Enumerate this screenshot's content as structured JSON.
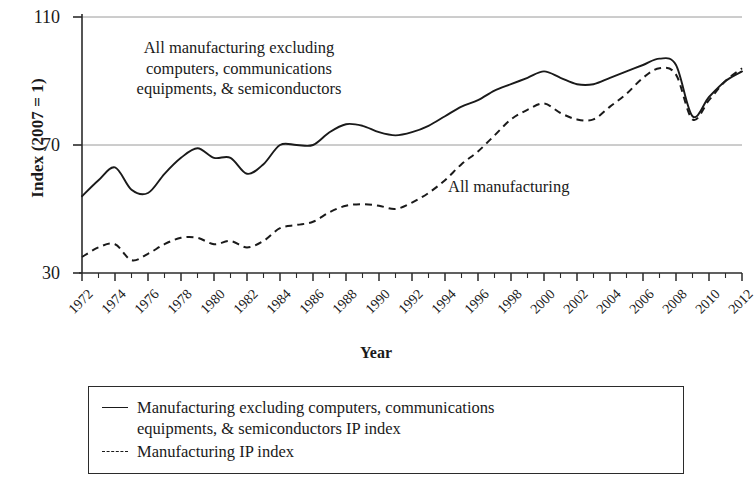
{
  "chart_data": {
    "type": "line",
    "title": "",
    "xlabel": "Year",
    "ylabel": "Index (2007 = 1)",
    "xlim": [
      1972,
      2012
    ],
    "ylim": [
      30,
      110
    ],
    "yticks": [
      30,
      70,
      110
    ],
    "ytick_labels": [
      "30",
      "70",
      "110"
    ],
    "xticks": [
      1972,
      1974,
      1976,
      1978,
      1980,
      1982,
      1984,
      1986,
      1988,
      1990,
      1992,
      1994,
      1996,
      1998,
      2000,
      2002,
      2004,
      2006,
      2008,
      2010,
      2012
    ],
    "xtick_labels": [
      "1972",
      "1974",
      "1976",
      "1978",
      "1980",
      "1982",
      "1984",
      "1986",
      "1988",
      "1990",
      "1992",
      "1994",
      "1996",
      "1998",
      "2000",
      "2002",
      "2004",
      "2006",
      "2008",
      "2010",
      "2012"
    ],
    "xtick_minor_step": 1,
    "grid": "horizontal gridlines at 70 and 110 only",
    "legend_position": "below plot, bordered box",
    "x": [
      1972,
      1973,
      1974,
      1975,
      1976,
      1977,
      1978,
      1979,
      1980,
      1981,
      1982,
      1983,
      1984,
      1985,
      1986,
      1987,
      1988,
      1989,
      1990,
      1991,
      1992,
      1993,
      1994,
      1995,
      1996,
      1997,
      1998,
      1999,
      2000,
      2001,
      2002,
      2003,
      2004,
      2005,
      2006,
      2007,
      2008,
      2009,
      2010,
      2011,
      2012
    ],
    "series": [
      {
        "name": "Manufacturing excluding computers, communications equipments, & semiconductors IP index",
        "style": "solid",
        "color": "#1a1a1a",
        "values": [
          54,
          59,
          63,
          56,
          55,
          61,
          66,
          69,
          66,
          66,
          61,
          64,
          70,
          70,
          70,
          74,
          76.5,
          76,
          74,
          73,
          74,
          76,
          79,
          82,
          84,
          87,
          89,
          91,
          93,
          91,
          89,
          89,
          91,
          93,
          95,
          97,
          95,
          79,
          85,
          90,
          93
        ]
      },
      {
        "name": "Manufacturing IP index",
        "style": "dashed",
        "color": "#1a1a1a",
        "values": [
          35,
          38,
          39,
          34,
          36,
          39,
          41,
          41,
          39,
          40,
          38,
          40,
          44,
          45,
          46,
          49,
          51,
          51.5,
          51,
          50,
          52,
          55,
          59,
          64,
          68,
          73,
          78,
          81,
          83,
          80,
          78,
          78,
          82,
          86,
          91,
          94,
          92,
          78,
          84,
          90,
          94
        ]
      }
    ],
    "annotations": [
      {
        "text": "All manufacturing excluding\ncomputers, communications\nequipments, & semiconductors",
        "series": "solid",
        "x": 1980,
        "y": 100
      },
      {
        "text": "All manufacturing",
        "series": "dashed",
        "x": 1995,
        "y": 58
      }
    ]
  },
  "axes": {
    "y_title": "Index (2007 = 1)",
    "x_title": "Year",
    "y_labels": [
      "110",
      "70",
      "30"
    ],
    "x_labels": [
      "1972",
      "1974",
      "1976",
      "1978",
      "1980",
      "1982",
      "1984",
      "1986",
      "1988",
      "1990",
      "1992",
      "1994",
      "1996",
      "1998",
      "2000",
      "2002",
      "2004",
      "2006",
      "2008",
      "2010",
      "2012"
    ]
  },
  "annotations": {
    "solid_label": "All manufacturing excluding\ncomputers, communications\nequipments, & semiconductors",
    "dashed_label": "All manufacturing"
  },
  "legend": {
    "items": [
      {
        "marker": "solid-line",
        "label": "Manufacturing excluding computers, communications\nequipments, & semiconductors IP index"
      },
      {
        "marker": "dashed-line",
        "label": "Manufacturing IP index"
      }
    ]
  },
  "colors": {
    "line": "#1a1a1a",
    "axis": "#2b2b2b",
    "grid": "#9a9a9a",
    "background": "#ffffff"
  }
}
